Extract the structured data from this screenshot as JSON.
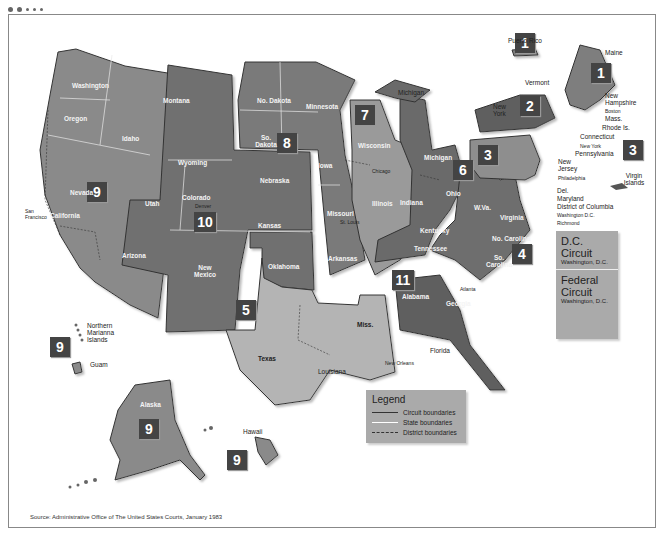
{
  "window": {
    "dots": 5
  },
  "map": {
    "title": "United States Federal Judicial Circuits",
    "colors": {
      "circuit_dark": "#6e6e6e",
      "circuit_mid": "#8a8a8a",
      "circuit_light": "#b4b4b4",
      "badge": "#444444",
      "panel": "#aaaaaa"
    },
    "circuits": [
      {
        "number": "1",
        "states": [
          "Maine",
          "New Hampshire",
          "Mass.",
          "Rhode Is.",
          "Puerto Rico"
        ]
      },
      {
        "number": "2",
        "states": [
          "Vermont",
          "New York",
          "Connecticut"
        ]
      },
      {
        "number": "3",
        "states": [
          "Pennsylvania",
          "New Jersey",
          "Del.",
          "Virgin Islands"
        ]
      },
      {
        "number": "4",
        "states": [
          "Maryland",
          "Virginia",
          "W. Va.",
          "No. Carolina",
          "So. Carolina"
        ]
      },
      {
        "number": "5",
        "states": [
          "Texas",
          "Louisiana",
          "Miss."
        ]
      },
      {
        "number": "6",
        "states": [
          "Michigan",
          "Ohio",
          "Kentucky",
          "Tennessee"
        ]
      },
      {
        "number": "7",
        "states": [
          "Wisconsin",
          "Illinois",
          "Indiana"
        ]
      },
      {
        "number": "8",
        "states": [
          "No. Dakota",
          "So. Dakota",
          "Nebraska",
          "Minnesota",
          "Iowa",
          "Missouri",
          "Arkansas"
        ]
      },
      {
        "number": "9",
        "states": [
          "Washington",
          "Oregon",
          "Idaho",
          "Montana",
          "Nevada",
          "California",
          "Arizona",
          "Alaska",
          "Hawaii",
          "Guam",
          "Northern Marianna Islands"
        ]
      },
      {
        "number": "10",
        "states": [
          "Wyoming",
          "Utah",
          "Colorado",
          "Kansas",
          "New Mexico",
          "Oklahoma"
        ]
      },
      {
        "number": "11",
        "states": [
          "Alabama",
          "Georgia",
          "Florida"
        ]
      }
    ],
    "state_labels": {
      "washington": "Washington",
      "oregon": "Oregon",
      "idaho": "Idaho",
      "montana": "Montana",
      "wyoming": "Wyoming",
      "nevada": "Nevada",
      "california": "California",
      "utah": "Utah",
      "colorado": "Colorado",
      "arizona": "Arizona",
      "new_mexico": "New Mexico",
      "kansas": "Kansas",
      "oklahoma": "Oklahoma",
      "nodakota": "No. Dakota",
      "sodakota": "So. Dakota",
      "nebraska": "Nebraska",
      "minnesota": "Minnesota",
      "iowa": "Iowa",
      "missouri": "Missouri",
      "arkansas": "Arkansas",
      "wisconsin": "Wisconsin",
      "illinois": "Illinois",
      "indiana": "Indiana",
      "michigan": "Michigan",
      "ohio": "Ohio",
      "kentucky": "Kentucky",
      "tennessee": "Tennessee",
      "wva": "W.Va.",
      "virginia": "Virginia",
      "nocarolina": "No. Carolina",
      "socarolina": "So. Carolina",
      "alabama": "Alabama",
      "georgia": "Georgia",
      "texas": "Texas",
      "miss": "Miss.",
      "alaska": "Alaska"
    },
    "callouts": {
      "puerto_rico": "Puerto Rico",
      "maine": "Maine",
      "vermont": "Vermont",
      "new_york": "New York",
      "new_hampshire": "New Hampshire",
      "boston": "Boston",
      "mass": "Mass.",
      "rhode_is": "Rhode Is.",
      "connecticut": "Connecticut",
      "new_york_city": "New York",
      "pennsylvania": "Pennsylvania",
      "new_jersey": "New Jersey",
      "philadelphia": "Philadelphia",
      "del": "Del.",
      "maryland": "Maryland",
      "dc": "District of Columbia",
      "washington_dc": "Washington D.C.",
      "richmond": "Richmond",
      "virgin_islands": "Virgin Islands",
      "michigan_up": "Michigan",
      "chicago": "Chicago",
      "cincinnati": "Cincinnati",
      "st_louis": "St. Louis",
      "atlanta": "Atlanta",
      "denver": "Denver",
      "san_francisco": "San Francisco",
      "new_orleans": "New Orleans",
      "louisiana": "Louisiana",
      "florida": "Florida",
      "hawaii": "Hawaii",
      "guam": "Guam",
      "northern_marianna": "Northern Marianna Islands"
    },
    "dc_circuit": {
      "title_line1": "D.C.",
      "title_line2": "Circuit",
      "city": "Washington, D.C."
    },
    "federal_circuit": {
      "title_line1": "Federal",
      "title_line2": "Circuit",
      "city": "Washington, D.C."
    },
    "legend": {
      "title": "Legend",
      "items": [
        {
          "label": "Circuit boundaries",
          "style": "solid-dark"
        },
        {
          "label": "State boundaries",
          "style": "solid-white"
        },
        {
          "label": "District boundaries",
          "style": "dashed"
        }
      ]
    },
    "source": "Source: Administrative Office of The United States Courts, January 1983"
  }
}
